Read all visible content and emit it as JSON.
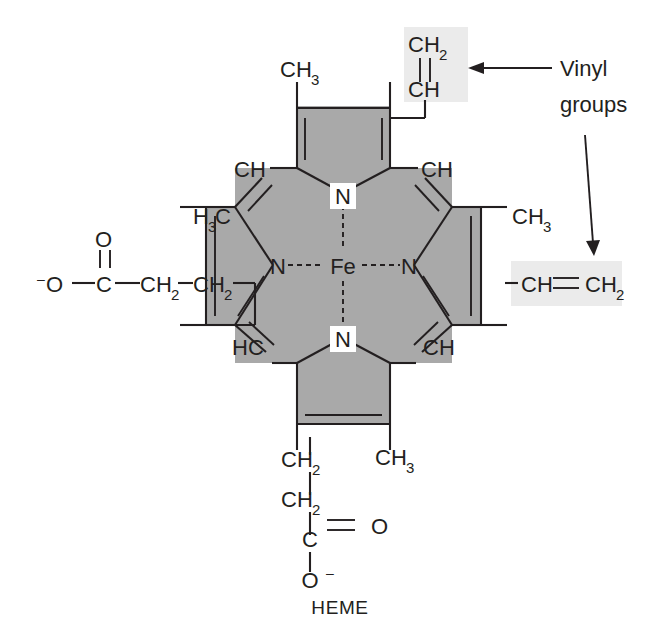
{
  "title": "HEME",
  "molecule": {
    "name": "heme",
    "center_atom": "Fe",
    "core_nitrogens": [
      "N",
      "N",
      "N",
      "N"
    ],
    "caption": "HEME"
  },
  "annotations": [
    {
      "id": "vinyl-annotation",
      "line1": "Vinyl",
      "line2": "groups"
    }
  ],
  "labels": {
    "fe": "Fe",
    "n_top": "N",
    "n_left": "N",
    "n_right": "N",
    "n_bottom": "N",
    "meso_top_left": "CH",
    "meso_top_right": "CH",
    "meso_bottom_left": "HC",
    "meso_bottom_right": "CH",
    "methyl_top": "CH",
    "methyl_top_sub": "3",
    "methyl_left": "H",
    "methyl_left_sub": "3",
    "methyl_left_c": "C",
    "methyl_right": "CH",
    "methyl_right_sub": "3",
    "methyl_bottom": "CH",
    "methyl_bottom_sub": "3",
    "vinyl_top_ch2": "CH",
    "vinyl_top_ch2_sub": "2",
    "vinyl_top_ch": "CH",
    "vinyl_right_ch": "CH",
    "vinyl_right_ch2": "CH",
    "vinyl_right_ch2_sub": "2",
    "prop_left_o_minus": "O",
    "prop_left_o_charge": "–",
    "prop_left_c": "C",
    "prop_left_o_double": "O",
    "prop_left_ch2_a": "CH",
    "prop_left_ch2_a_sub": "2",
    "prop_left_ch2_b": "CH",
    "prop_left_ch2_b_sub": "2",
    "prop_bottom_ch2_a": "CH",
    "prop_bottom_ch2_a_sub": "2",
    "prop_bottom_ch2_b": "CH",
    "prop_bottom_ch2_b_sub": "2",
    "prop_bottom_c": "C",
    "prop_bottom_o_double": "O",
    "prop_bottom_o_minus": "O",
    "prop_bottom_o_charge": "–"
  },
  "colors": {
    "background": "#ffffff",
    "core_fill": "#a9a9a9",
    "highlight_fill": "#ebebeb",
    "ink": "#231f20"
  }
}
